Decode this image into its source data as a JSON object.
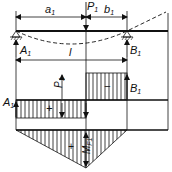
{
  "diagram": {
    "type": "beam-overhang-point-load",
    "labels": {
      "a": "a",
      "a_sub": "1",
      "b": "b",
      "b_sub": "1",
      "P": "P",
      "P_sub": "1",
      "A": "A",
      "A_sub": "1",
      "B": "B",
      "B_sub": "1",
      "span": "l",
      "shear_P": "P",
      "shear_P_sub": "1",
      "shear_A": "A",
      "shear_A_sub": "1",
      "shear_B": "B",
      "shear_B_sub": "1",
      "plus_shear": "+",
      "minus_shear": "−",
      "plus_moment": "+",
      "moment": "M",
      "moment_sub": "F1"
    },
    "colors": {
      "line": "#111111",
      "background": "#ffffff"
    }
  }
}
